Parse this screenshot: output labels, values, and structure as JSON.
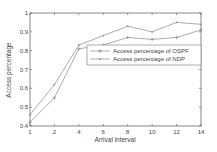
{
  "chart_data": {
    "type": "line",
    "title": "",
    "xlabel": "Arrival interval",
    "ylabel": "Access percentage",
    "x": [
      1,
      2,
      4,
      6,
      8,
      10,
      12,
      14
    ],
    "x_tick_labels": [
      "1",
      "2",
      "4",
      "6",
      "8",
      "10",
      "12",
      "14"
    ],
    "y_tick_labels": [
      "0.4",
      "0.5",
      "0.6",
      "0.7",
      "0.8",
      "0.9",
      "1"
    ],
    "ylim": [
      0.4,
      1.0
    ],
    "grid": false,
    "legend_position": "center-right",
    "series": [
      {
        "name": "Access percentage of OSPF",
        "marker": "+",
        "values": [
          0.42,
          0.55,
          0.81,
          0.83,
          0.87,
          0.86,
          0.87,
          0.91
        ]
      },
      {
        "name": "Access percentage of NDP",
        "marker": ".",
        "values": [
          0.46,
          0.62,
          0.83,
          0.88,
          0.93,
          0.9,
          0.95,
          0.94
        ]
      }
    ],
    "colors": {
      "line": "#8a8a8a",
      "axis": "#555555",
      "text": "#444444"
    }
  }
}
